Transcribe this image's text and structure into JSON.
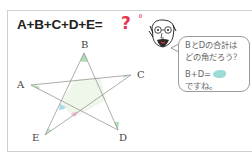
{
  "problem": {
    "equation": "A+B+C+D+E=",
    "unknown": "?",
    "degree": "°",
    "accent_color": "#e8364f"
  },
  "figure": {
    "type": "five-pointed star",
    "vertices": [
      {
        "label": "A",
        "x": 31,
        "y": 85
      },
      {
        "label": "B",
        "x": 84,
        "y": 53
      },
      {
        "label": "C",
        "x": 131,
        "y": 75
      },
      {
        "label": "D",
        "x": 118,
        "y": 130
      },
      {
        "label": "E",
        "x": 45,
        "y": 135
      }
    ],
    "fill_color": "#eef7ea",
    "angle_marks": {
      "blue": "#a9dcea",
      "pink": "#f4c6d6",
      "green": "#b5ddb5"
    }
  },
  "hint": {
    "line1": "BとDの合計は",
    "line2": "どの角だろう？",
    "line3": "B+D=",
    "line4": "ですね。",
    "blob_color": "#9ddbd6"
  }
}
